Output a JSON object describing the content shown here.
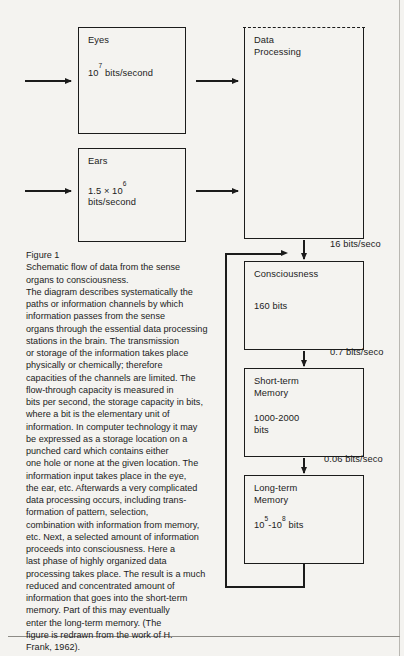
{
  "figure": {
    "label": "Figure 1",
    "caption_lead": "Schematic flow of data from the sense\norgans to consciousness.",
    "caption_body": "The diagram describes systematically the\npaths or information channels by which\ninformation passes from the sense\norgans through the essential data processing\nstations in the brain. The transmission\nor storage of the information takes place\nphysically or chemically; therefore\ncapacities of the channels are limited. The\nflow-through capacity is measured in\nbits per second, the storage capacity in bits,\nwhere a bit is the elementary unit of\ninformation. In computer technology it may\nbe expressed as a storage location on a\npunched card which contains either\none hole or none at the given location. The\ninformation input takes place in the eye,\nthe ear, etc. Afterwards a very complicated\ndata processing occurs, including trans-\nformation of pattern, selection,\ncombination with information from memory,\netc. Next, a selected amount of information\nproceeds into consciousness. Here a\nlast phase of highly organized data\nprocessing takes place. The result is a much\nreduced and concentrated amount of\ninformation that goes into the short-term\nmemory. Part of this may eventually\nenter the long-term memory. (The\nfigure is redrawn from the work of H.\nFrank, 1962)."
  },
  "diagram": {
    "sense_organs": [
      {
        "id": "eyes",
        "title": "Eyes",
        "value_mantissa": "10",
        "value_exponent": "7",
        "value_unit": " bits/second",
        "value_prefix": ""
      },
      {
        "id": "ears",
        "title": "Ears",
        "value_prefix": "1.5 × 10",
        "value_exponent": "6",
        "value_unit": "\nbits/second",
        "value_mantissa": ""
      }
    ],
    "processing": {
      "title": "Data\nProcessing"
    },
    "stages": [
      {
        "id": "consciousness",
        "title": "Consciousness",
        "value": "160 bits"
      },
      {
        "id": "short-term-memory",
        "title": "Short-term\nMemory",
        "value": "1000-2000\nbits"
      },
      {
        "id": "long-term-memory",
        "title": "Long-term\nMemory",
        "value_prefix": "10",
        "value_exp1": "5",
        "value_mid": "-10",
        "value_exp2": "8",
        "value_suffix": " bits"
      }
    ],
    "rates": [
      {
        "id": "rate-data-processing",
        "text": "16 bits/seco"
      },
      {
        "id": "rate-consciousness",
        "text": "0.7 bits/seco"
      },
      {
        "id": "rate-short-term",
        "text": "0.06 bits/seco"
      }
    ]
  },
  "colors": {
    "ink": "#1b1b1b",
    "paper": "#f4f3f0"
  }
}
